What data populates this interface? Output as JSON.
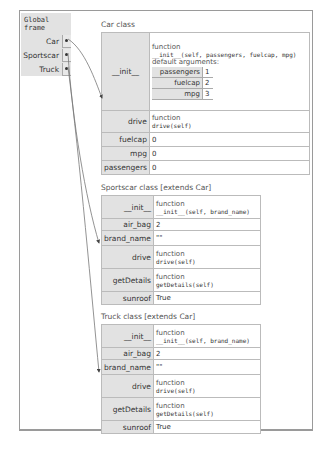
{
  "global_frame": {
    "title": "Global frame",
    "vars": [
      {
        "name": "Car"
      },
      {
        "name": "Sportscar"
      },
      {
        "name": "Truck"
      }
    ]
  },
  "car": {
    "title": "Car class",
    "init": {
      "key": "__init__",
      "kind": "function",
      "signature": "__init__(self, passengers, fuelcap, mpg)",
      "defaults_label": "default arguments:",
      "defaults": [
        {
          "k": "passengers",
          "v": "1"
        },
        {
          "k": "fuelcap",
          "v": "2"
        },
        {
          "k": "mpg",
          "v": "3"
        }
      ]
    },
    "drive": {
      "key": "drive",
      "kind": "function",
      "signature": "drive(self)"
    },
    "fuelcap": {
      "key": "fuelcap",
      "value": "0"
    },
    "mpg": {
      "key": "mpg",
      "value": "0"
    },
    "passengers": {
      "key": "passengers",
      "value": "0"
    }
  },
  "sportscar": {
    "title": "Sportscar class [extends Car]",
    "init": {
      "key": "__init__",
      "kind": "function",
      "signature": "__init__(self, brand_name)"
    },
    "air_bag": {
      "key": "air_bag",
      "value": "2"
    },
    "brand_name": {
      "key": "brand_name",
      "value": "\"\""
    },
    "drive": {
      "key": "drive",
      "kind": "function",
      "signature": "drive(self)"
    },
    "getDetails": {
      "key": "getDetails",
      "kind": "function",
      "signature": "getDetails(self)"
    },
    "sunroof": {
      "key": "sunroof",
      "value": "True"
    }
  },
  "truck": {
    "title": "Truck class [extends Car]",
    "init": {
      "key": "__init__",
      "kind": "function",
      "signature": "__init__(self, brand_name)"
    },
    "air_bag": {
      "key": "air_bag",
      "value": "2"
    },
    "brand_name": {
      "key": "brand_name",
      "value": "\"\""
    },
    "drive": {
      "key": "drive",
      "kind": "function",
      "signature": "drive(self)"
    },
    "getDetails": {
      "key": "getDetails",
      "kind": "function",
      "signature": "getDetails(self)"
    },
    "sunroof": {
      "key": "sunroof",
      "value": "True"
    }
  }
}
